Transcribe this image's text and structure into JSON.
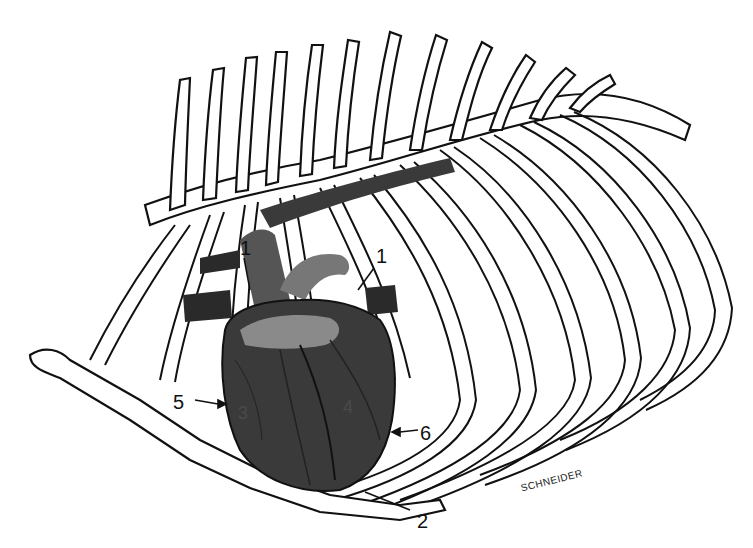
{
  "figure": {
    "labels": [
      {
        "id": "1a",
        "text": "1",
        "x": 240,
        "y": 240
      },
      {
        "id": "1b",
        "text": "1",
        "x": 376,
        "y": 250
      },
      {
        "id": "2",
        "text": "2",
        "x": 417,
        "y": 512
      },
      {
        "id": "3",
        "text": "3",
        "x": 238,
        "y": 404
      },
      {
        "id": "4",
        "text": "4",
        "x": 345,
        "y": 400
      },
      {
        "id": "5",
        "text": "5",
        "x": 173,
        "y": 394
      },
      {
        "id": "6",
        "text": "6",
        "x": 420,
        "y": 424
      }
    ],
    "signature": "SCHNEIDER",
    "colors": {
      "background": "#ffffff",
      "outline": "#111111",
      "heart_dark": "#3a3a3a",
      "heart_mid": "#7a7a7a",
      "heart_light": "#9a9a9a",
      "vessel": "#2a2a2a"
    }
  }
}
